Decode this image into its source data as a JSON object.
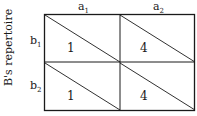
{
  "axis": {
    "y_label": "B's repertoire"
  },
  "columns": [
    {
      "base": "a",
      "sub": "1"
    },
    {
      "base": "a",
      "sub": "2"
    }
  ],
  "rows": [
    {
      "base": "b",
      "sub": "1"
    },
    {
      "base": "b",
      "sub": "2"
    }
  ],
  "cells": [
    [
      "1",
      "4"
    ],
    [
      "1",
      "4"
    ]
  ],
  "colors": {
    "line": "#1a1a1a",
    "background": "#ffffff"
  }
}
